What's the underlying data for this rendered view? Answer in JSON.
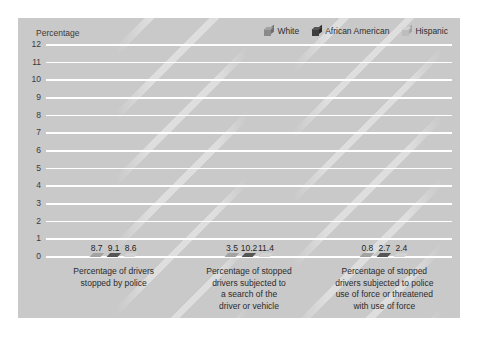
{
  "chart_data": {
    "type": "bar",
    "title": "",
    "subtitle": "",
    "ylabel": "Percentage",
    "xlabel": "",
    "ylim": [
      0,
      12
    ],
    "ytick_labels": [
      "12",
      "11",
      "10",
      "9",
      "8",
      "7",
      "6",
      "5",
      "4",
      "3",
      "2",
      "1",
      "0"
    ],
    "ytick_values": [
      12,
      11,
      10,
      9,
      8,
      7,
      6,
      5,
      4,
      3,
      2,
      1,
      0
    ],
    "grid": true,
    "legend_position": "top-right",
    "style": "3d-grouped-bar",
    "categories": [
      "Percentage of drivers stopped by police",
      "Percentage of stopped drivers subjected to a search of the driver or vehicle",
      "Percentage of stopped drivers subjected to police use of force or threatened with use of force"
    ],
    "category_lines": [
      [
        "Percentage of drivers",
        "stopped by police"
      ],
      [
        "Percentage of stopped",
        "drivers subjected to",
        "a search of the",
        "driver or vehicle"
      ],
      [
        "Percentage of stopped",
        "drivers subjected to police",
        "use of force or threatened",
        "with use of force"
      ]
    ],
    "series": [
      {
        "name": "White",
        "color": "#8a8a8a",
        "color_side": "#6f6f6f",
        "color_top": "#a2a2a2",
        "values": [
          8.7,
          3.5,
          0.8
        ],
        "labels": [
          "8.7",
          "3.5",
          "0.8"
        ]
      },
      {
        "name": "African American",
        "color": "#3d3d3d",
        "color_side": "#2a2a2a",
        "color_top": "#555555",
        "values": [
          9.1,
          10.2,
          2.7
        ],
        "labels": [
          "9.1",
          "10.2",
          "2.7"
        ]
      },
      {
        "name": "Hispanic",
        "color": "#bdbdbd",
        "color_side": "#a4a4a4",
        "color_top": "#d2d2d2",
        "values": [
          8.6,
          11.4,
          2.4
        ],
        "labels": [
          "8.6",
          "11.4",
          "2.4"
        ]
      }
    ]
  },
  "colors": {
    "panel_background": "#c9c9c9",
    "page_background": "#ffffff",
    "gridline": "#ffffff",
    "text": "#2b2b2b"
  }
}
